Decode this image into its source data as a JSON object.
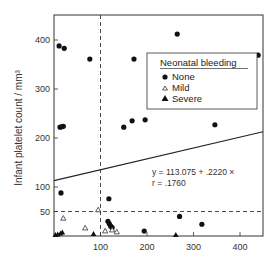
{
  "chart_data": {
    "type": "scatter",
    "title": "",
    "xlabel": "",
    "ylabel": "Infant platelet count / mm³",
    "xlim": [
      0,
      450
    ],
    "ylim": [
      0,
      450
    ],
    "x_ticks": [
      100,
      200,
      300,
      400
    ],
    "y_ticks": [
      50,
      100,
      200,
      300,
      400
    ],
    "grid": false,
    "reference_lines": [
      {
        "orientation": "vertical",
        "value": 100,
        "style": "dashed"
      },
      {
        "orientation": "horizontal",
        "value": 50,
        "style": "dashed"
      }
    ],
    "regression": {
      "intercept": 113.075,
      "slope": 0.222,
      "r": 0.176,
      "equation_label": "y = 113.075  +  .2220 ×",
      "r_label": "r = .1760"
    },
    "legend": {
      "title": "Neonatal bleeding",
      "position": "upper right",
      "entries": [
        {
          "label": "None",
          "marker": "filled-circle"
        },
        {
          "label": "Mild",
          "marker": "open-triangle"
        },
        {
          "label": "Severe",
          "marker": "filled-triangle"
        }
      ]
    },
    "series": [
      {
        "name": "None",
        "marker": "filled-circle",
        "points": [
          [
            11,
            388
          ],
          [
            22,
            383
          ],
          [
            77,
            361
          ],
          [
            265,
            412
          ],
          [
            172,
            361
          ],
          [
            439,
            369
          ],
          [
            13,
            222
          ],
          [
            17,
            223
          ],
          [
            20,
            224
          ],
          [
            150,
            222
          ],
          [
            168,
            235
          ],
          [
            196,
            237
          ],
          [
            346,
            227
          ],
          [
            15,
            88
          ],
          [
            118,
            76
          ],
          [
            116,
            30
          ],
          [
            119,
            25
          ],
          [
            122,
            20
          ],
          [
            125,
            17
          ],
          [
            270,
            40
          ],
          [
            318,
            24
          ],
          [
            194,
            10
          ]
        ]
      },
      {
        "name": "Mild",
        "marker": "open-triangle",
        "points": [
          [
            20,
            36
          ],
          [
            67,
            16
          ],
          [
            95,
            53
          ],
          [
            110,
            10
          ],
          [
            125,
            12
          ],
          [
            135,
            8
          ]
        ]
      },
      {
        "name": "Severe",
        "marker": "filled-triangle",
        "points": [
          [
            3,
            2
          ],
          [
            8,
            3
          ],
          [
            14,
            5
          ],
          [
            18,
            7
          ],
          [
            85,
            4
          ],
          [
            262,
            2
          ]
        ]
      }
    ]
  }
}
